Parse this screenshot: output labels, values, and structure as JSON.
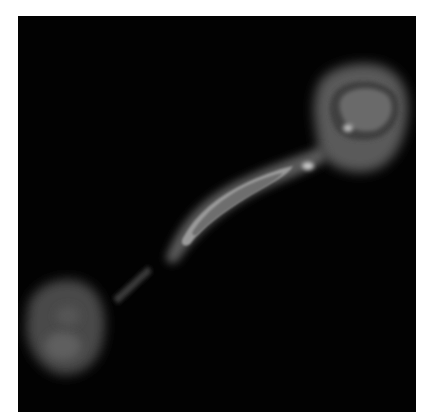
{
  "image": {
    "description": "Grayscale radio image of a double-lobed source with a curved jet on a black background",
    "background_color": "#020202",
    "page_background": "#ffffff",
    "features": [
      {
        "name": "northeast-lobe",
        "brightness": "medium-gray"
      },
      {
        "name": "curved-jet",
        "brightness": "bright"
      },
      {
        "name": "jet-knot",
        "brightness": "bright"
      },
      {
        "name": "faint-counterjet",
        "brightness": "dim"
      },
      {
        "name": "southwest-lobe",
        "brightness": "dim-gray"
      }
    ]
  }
}
